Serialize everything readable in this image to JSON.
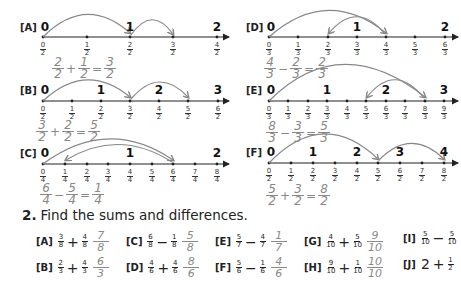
{
  "number_lines": [
    {
      "id": "A",
      "label": "[A]",
      "wholes": [
        "0",
        "1",
        "2"
      ],
      "ticks": [
        {
          "num": "0",
          "den": "2"
        },
        {
          "num": "1",
          "den": "2"
        },
        {
          "num": "2",
          "den": "2"
        },
        {
          "num": "3",
          "den": "2"
        },
        {
          "num": "4",
          "den": "2"
        }
      ],
      "work": {
        "a_num": "2",
        "a_den": "2",
        "op": "+",
        "b_num": "1",
        "b_den": "2",
        "eq": "=",
        "r_num": "3",
        "r_den": "2"
      }
    },
    {
      "id": "B",
      "label": "[B]",
      "wholes": [
        "0",
        "1",
        "2",
        "3"
      ],
      "ticks": [
        {
          "num": "0",
          "den": "2"
        },
        {
          "num": "1",
          "den": "2"
        },
        {
          "num": "2",
          "den": "2"
        },
        {
          "num": "3",
          "den": "2"
        },
        {
          "num": "4",
          "den": "2"
        },
        {
          "num": "5",
          "den": "2"
        },
        {
          "num": "6",
          "den": "2"
        }
      ],
      "work": {
        "a_num": "3",
        "a_den": "2",
        "op": "+",
        "b_num": "2",
        "b_den": "2",
        "eq": "=",
        "r_num": "5",
        "r_den": "2"
      }
    },
    {
      "id": "C",
      "label": "[C]",
      "wholes": [
        "0",
        "1",
        "2"
      ],
      "ticks": [
        {
          "num": "0",
          "den": "4"
        },
        {
          "num": "1",
          "den": "4"
        },
        {
          "num": "2",
          "den": "4"
        },
        {
          "num": "3",
          "den": "4"
        },
        {
          "num": "4",
          "den": "4"
        },
        {
          "num": "5",
          "den": "4"
        },
        {
          "num": "6",
          "den": "4"
        },
        {
          "num": "7",
          "den": "4"
        },
        {
          "num": "8",
          "den": "4"
        }
      ],
      "work": {
        "a_num": "6",
        "a_den": "4",
        "op": "−",
        "b_num": "5",
        "b_den": "4",
        "eq": "=",
        "r_num": "1",
        "r_den": "4"
      }
    },
    {
      "id": "D",
      "label": "[D]",
      "wholes": [
        "0",
        "1",
        "2"
      ],
      "ticks": [
        {
          "num": "0",
          "den": "3"
        },
        {
          "num": "1",
          "den": "3"
        },
        {
          "num": "2",
          "den": "3"
        },
        {
          "num": "3",
          "den": "3"
        },
        {
          "num": "4",
          "den": "3"
        },
        {
          "num": "5",
          "den": "3"
        },
        {
          "num": "6",
          "den": "3"
        }
      ],
      "work": {
        "a_num": "4",
        "a_den": "3",
        "op": "−",
        "b_num": "2",
        "b_den": "3",
        "eq": "=",
        "r_num": "2",
        "r_den": "3"
      }
    },
    {
      "id": "E",
      "label": "[E]",
      "wholes": [
        "0",
        "1",
        "2",
        "3"
      ],
      "ticks": [
        {
          "num": "0",
          "den": "3"
        },
        {
          "num": "1",
          "den": "3"
        },
        {
          "num": "2",
          "den": "3"
        },
        {
          "num": "3",
          "den": "3"
        },
        {
          "num": "4",
          "den": "3"
        },
        {
          "num": "5",
          "den": "3"
        },
        {
          "num": "6",
          "den": "3"
        },
        {
          "num": "7",
          "den": "3"
        },
        {
          "num": "8",
          "den": "3"
        },
        {
          "num": "9",
          "den": "3"
        }
      ],
      "work": {
        "a_num": "8",
        "a_den": "3",
        "op": "−",
        "b_num": "3",
        "b_den": "3",
        "eq": "=",
        "r_num": "5",
        "r_den": "3"
      }
    },
    {
      "id": "F",
      "label": "[F]",
      "wholes": [
        "0",
        "1",
        "2",
        "3",
        "4"
      ],
      "ticks": [
        {
          "num": "0",
          "den": "2"
        },
        {
          "num": "1",
          "den": "2"
        },
        {
          "num": "2",
          "den": "2"
        },
        {
          "num": "3",
          "den": "2"
        },
        {
          "num": "4",
          "den": "2"
        },
        {
          "num": "5",
          "den": "2"
        },
        {
          "num": "6",
          "den": "2"
        },
        {
          "num": "7",
          "den": "2"
        },
        {
          "num": "8",
          "den": "2"
        }
      ],
      "work": {
        "a_num": "5",
        "a_den": "2",
        "op": "+",
        "b_num": "3",
        "b_den": "2",
        "eq": "=",
        "r_num": "8",
        "r_den": "2"
      }
    }
  ],
  "section2": {
    "number": "2.",
    "instruction": "Find the sums and differences.",
    "exercises": [
      {
        "label": "[A]",
        "a_num": "3",
        "a_den": "8",
        "op": "+",
        "b_num": "4",
        "b_den": "8",
        "ans_num": "7",
        "ans_den": "8"
      },
      {
        "label": "[B]",
        "a_num": "2",
        "a_den": "3",
        "op": "+",
        "b_num": "4",
        "b_den": "3",
        "ans_num": "6",
        "ans_den": "3"
      },
      {
        "label": "[C]",
        "a_num": "6",
        "a_den": "8",
        "op": "−",
        "b_num": "1",
        "b_den": "8",
        "ans_num": "5",
        "ans_den": "8"
      },
      {
        "label": "[D]",
        "a_num": "4",
        "a_den": "6",
        "op": "+",
        "b_num": "4",
        "b_den": "6",
        "ans_num": "8",
        "ans_den": "6"
      },
      {
        "label": "[E]",
        "a_num": "5",
        "a_den": "7",
        "op": "−",
        "b_num": "4",
        "b_den": "7",
        "ans_num": "1",
        "ans_den": "7"
      },
      {
        "label": "[F]",
        "a_num": "5",
        "a_den": "6",
        "op": "−",
        "b_num": "1",
        "b_den": "6",
        "ans_num": "4",
        "ans_den": "6"
      },
      {
        "label": "[G]",
        "a_num": "4",
        "a_den": "10",
        "op": "+",
        "b_num": "5",
        "b_den": "10",
        "ans_num": "9",
        "ans_den": "10"
      },
      {
        "label": "[H]",
        "a_num": "9",
        "a_den": "10",
        "op": "+",
        "b_num": "1",
        "b_den": "10",
        "ans_num": "10",
        "ans_den": "10"
      },
      {
        "label": "[I]",
        "a_num": "5",
        "a_den": "10",
        "op": "−",
        "b_num": "5",
        "b_den": "10"
      },
      {
        "label": "[J]",
        "whole": "2",
        "op": "+",
        "b_num": "1",
        "b_den": "2"
      }
    ]
  },
  "colors": {
    "ink": "#1a1a1a",
    "pencil": "#8a8a8a",
    "paper": "#ffffff"
  }
}
